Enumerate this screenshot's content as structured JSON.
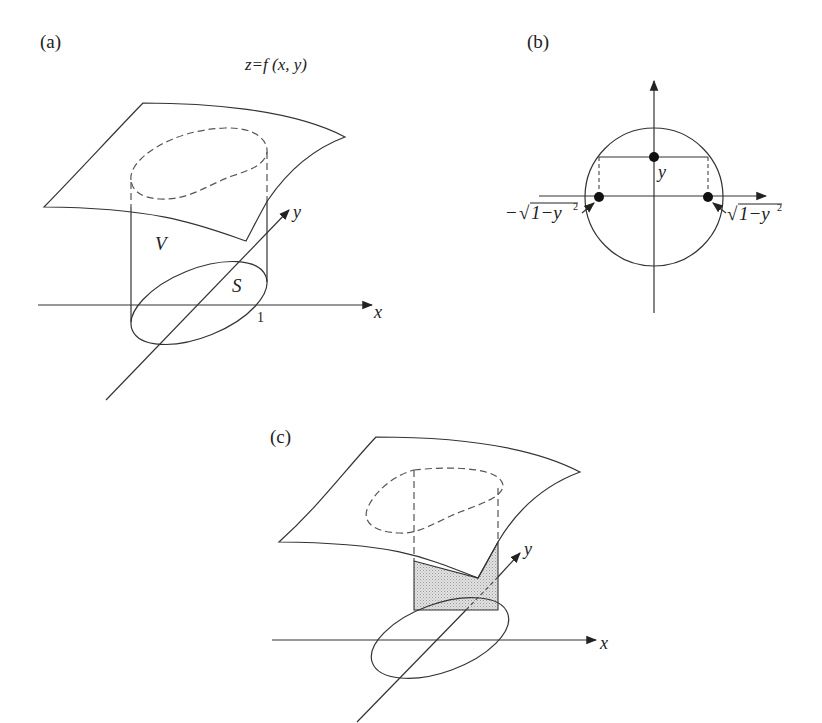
{
  "figure": {
    "panels": [
      {
        "id": "a",
        "label": "(a)",
        "surface_label": "z=f (x, y)",
        "volume_label": "V",
        "region_label": "S",
        "tick_label": "1",
        "axis_x_label": "x",
        "axis_y_label": "y"
      },
      {
        "id": "b",
        "label": "(b)",
        "point_label": "y",
        "left_label_minus": "−",
        "left_label_sqrt": "√",
        "left_label_body": "1−y",
        "left_label_exp": "2",
        "right_label_sqrt": "√",
        "right_label_body": "1−y",
        "right_label_exp": "2"
      },
      {
        "id": "c",
        "label": "(c)",
        "axis_x_label": "x",
        "axis_y_label": "y",
        "slice_fill": "#d4d4d4"
      }
    ],
    "colors": {
      "line": "#333333",
      "background": "#ffffff",
      "slice": "#d4d4d4"
    }
  }
}
